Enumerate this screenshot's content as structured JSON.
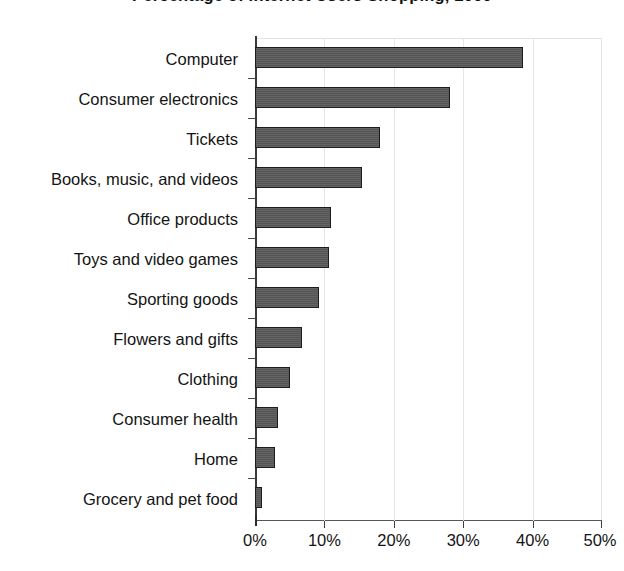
{
  "chart_data": {
    "type": "bar",
    "orientation": "horizontal",
    "title": "Percentage of Internet Users Shopping, 2000",
    "xlabel": "",
    "ylabel": "",
    "xlim": [
      0,
      50
    ],
    "xunit": "%",
    "grid": true,
    "legend": false,
    "categories": [
      "Computer",
      "Consumer electronics",
      "Tickets",
      "Books, music, and videos",
      "Office products",
      "Toys and video games",
      "Sporting goods",
      "Flowers and gifts",
      "Clothing",
      "Consumer health",
      "Home",
      "Grocery and pet food"
    ],
    "values": [
      38.6,
      28.1,
      18.0,
      15.4,
      11.0,
      10.6,
      9.2,
      6.8,
      5.0,
      3.3,
      2.9,
      1.0
    ],
    "xticks": [
      0,
      10,
      20,
      30,
      40,
      50
    ],
    "xtick_labels": [
      "0%",
      "10%",
      "20%",
      "30%",
      "40%",
      "50%"
    ],
    "bar_color": "#585858",
    "bar_edge_color": "#1c1c1c",
    "grid_color": "#e6e6e6",
    "axis_color": "#3a3a3a",
    "background_color": "#ffffff"
  }
}
